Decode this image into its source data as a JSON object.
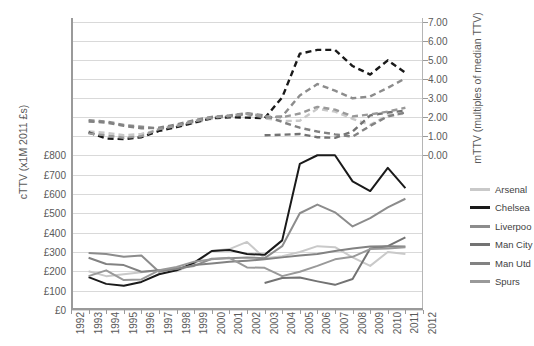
{
  "chart_data": {
    "type": "line",
    "title": "",
    "xlabel": "",
    "ylabel": "cTTV (x1M 2011 £s)",
    "y2label": "mTTV (multiples of median TTV)",
    "x": [
      1992,
      1993,
      1994,
      1995,
      1996,
      1997,
      1998,
      1999,
      2000,
      2001,
      2002,
      2003,
      2004,
      2005,
      2006,
      2007,
      2008,
      2009,
      2010,
      2011,
      2012
    ],
    "xlim": [
      1992,
      2012
    ],
    "xticklabels": [
      "1992",
      "1993",
      "1994",
      "1995",
      "1996",
      "1997",
      "1998",
      "1999",
      "2000",
      "2001",
      "2002",
      "2003",
      "2004",
      "2005",
      "2006",
      "2007",
      "2008",
      "2009",
      "2010",
      "2011",
      "2012"
    ],
    "ylim": [
      0,
      800
    ],
    "yticklabels": [
      "£0",
      "£100",
      "£200",
      "£300",
      "£400",
      "£500",
      "£600",
      "£700",
      "£800"
    ],
    "yticks": [
      0,
      100,
      200,
      300,
      400,
      500,
      600,
      700,
      800
    ],
    "y2lim": [
      0,
      7
    ],
    "y2ticklabels": [
      "0.00",
      "1.00",
      "2.00",
      "3.00",
      "4.00",
      "5.00",
      "6.00",
      "7.00"
    ],
    "y2ticks": [
      0,
      1,
      2,
      3,
      4,
      5,
      6,
      7
    ],
    "grid": true,
    "legend_position": "right",
    "series": [
      {
        "name": "Arsenal",
        "color": "#c9c9c9",
        "style": "solid",
        "axis": "left",
        "x": [
          1993,
          1994,
          1995,
          1996,
          1997,
          1998,
          1999,
          2000,
          2001,
          2002,
          2003,
          2004,
          2005,
          2006,
          2007,
          2008,
          2009,
          2010,
          2011
        ],
        "values": [
          200,
          175,
          185,
          195,
          205,
          200,
          240,
          305,
          315,
          352,
          268,
          278,
          300,
          330,
          325,
          272,
          228,
          300,
          290
        ]
      },
      {
        "name": "Chelsea",
        "color": "#1a1a1a",
        "style": "solid",
        "axis": "left",
        "x": [
          1993,
          1994,
          1995,
          1996,
          1997,
          1998,
          1999,
          2000,
          2001,
          2002,
          2003,
          2004,
          2005,
          2006,
          2007,
          2008,
          2009,
          2010,
          2011
        ],
        "values": [
          170,
          135,
          125,
          145,
          185,
          205,
          245,
          305,
          310,
          290,
          285,
          360,
          755,
          800,
          800,
          665,
          615,
          735,
          630
        ]
      },
      {
        "name": "Liverpool",
        "color": "#8c8c8c",
        "style": "solid",
        "axis": "left",
        "x": [
          1993,
          1994,
          1995,
          1996,
          1997,
          1998,
          1999,
          2000,
          2001,
          2002,
          2003,
          2004,
          2005,
          2006,
          2007,
          2008,
          2009,
          2010,
          2011
        ],
        "values": [
          295,
          290,
          275,
          282,
          198,
          215,
          228,
          265,
          268,
          272,
          268,
          330,
          500,
          545,
          505,
          432,
          475,
          530,
          575
        ]
      },
      {
        "name": "Man City",
        "color": "#737373",
        "style": "solid",
        "axis": "left",
        "x": [
          2003,
          2004,
          2005,
          2006,
          2007,
          2008,
          2009,
          2010,
          2011
        ],
        "values": [
          140,
          165,
          168,
          148,
          130,
          160,
          318,
          330,
          375
        ]
      },
      {
        "name": "Man Utd",
        "color": "#828282",
        "style": "solid",
        "axis": "left",
        "x": [
          1993,
          1994,
          1995,
          1996,
          1997,
          1998,
          1999,
          2000,
          2001,
          2002,
          2003,
          2004,
          2005,
          2006,
          2007,
          2008,
          2009,
          2010,
          2011
        ],
        "values": [
          270,
          238,
          232,
          198,
          205,
          212,
          232,
          240,
          250,
          255,
          262,
          272,
          282,
          290,
          305,
          318,
          328,
          330,
          328
        ]
      },
      {
        "name": "Spurs",
        "color": "#999999",
        "style": "solid",
        "axis": "left",
        "x": [
          1993,
          1994,
          1995,
          1996,
          1997,
          1998,
          1999,
          2000,
          2001,
          2002,
          2003,
          2004,
          2005,
          2006,
          2007,
          2008,
          2009,
          2010,
          2011
        ],
        "values": [
          175,
          205,
          155,
          158,
          205,
          222,
          250,
          262,
          270,
          220,
          218,
          175,
          198,
          228,
          262,
          275,
          315,
          318,
          325
        ]
      },
      {
        "name": "Arsenal",
        "color": "#c9c9c9",
        "style": "dashed",
        "axis": "right",
        "x": [
          1993,
          1994,
          1995,
          1996,
          1997,
          1998,
          1999,
          2000,
          2001,
          2002,
          2003,
          2004,
          2005,
          2006,
          2007,
          2008,
          2009,
          2010,
          2011
        ],
        "values": [
          1.25,
          1.18,
          1.05,
          1.12,
          1.35,
          1.5,
          1.7,
          1.92,
          2.02,
          2.15,
          1.95,
          1.8,
          1.82,
          2.45,
          2.3,
          1.92,
          1.6,
          2.1,
          2.2
        ]
      },
      {
        "name": "Chelsea",
        "color": "#1a1a1a",
        "style": "dashed",
        "axis": "right",
        "x": [
          1993,
          1994,
          1995,
          1996,
          1997,
          1998,
          1999,
          2000,
          2001,
          2002,
          2003,
          2004,
          2005,
          2006,
          2007,
          2008,
          2009,
          2010,
          2011
        ],
        "values": [
          1.2,
          0.88,
          0.85,
          0.95,
          1.28,
          1.48,
          1.72,
          1.95,
          2.0,
          1.98,
          1.95,
          3.05,
          5.35,
          5.55,
          5.55,
          4.7,
          4.25,
          5.0,
          4.35
        ]
      },
      {
        "name": "Liverpool",
        "color": "#8c8c8c",
        "style": "dashed",
        "axis": "right",
        "x": [
          1993,
          1994,
          1995,
          1996,
          1997,
          1998,
          1999,
          2000,
          2001,
          2002,
          2003,
          2004,
          2005,
          2006,
          2007,
          2008,
          2009,
          2010,
          2011
        ],
        "values": [
          1.85,
          1.78,
          1.6,
          1.5,
          1.4,
          1.55,
          1.78,
          1.98,
          2.05,
          2.18,
          1.98,
          2.05,
          3.15,
          3.75,
          3.4,
          3.0,
          3.1,
          3.55,
          4.05
        ]
      },
      {
        "name": "Man City",
        "color": "#737373",
        "style": "dashed",
        "axis": "right",
        "x": [
          2003,
          2004,
          2005,
          2006,
          2007,
          2008,
          2009,
          2010,
          2011
        ],
        "values": [
          1.05,
          1.08,
          1.12,
          0.95,
          0.92,
          1.25,
          2.1,
          2.25,
          2.35
        ]
      },
      {
        "name": "Man Utd",
        "color": "#828282",
        "style": "dashed",
        "axis": "right",
        "x": [
          1993,
          1994,
          1995,
          1996,
          1997,
          1998,
          1999,
          2000,
          2001,
          2002,
          2003,
          2004,
          2005,
          2006,
          2007,
          2008,
          2009,
          2010,
          2011
        ],
        "values": [
          1.78,
          1.72,
          1.55,
          1.42,
          1.45,
          1.62,
          1.85,
          2.02,
          2.1,
          2.22,
          2.1,
          1.75,
          1.45,
          1.25,
          1.1,
          0.98,
          1.55,
          2.05,
          2.25
        ]
      },
      {
        "name": "Spurs",
        "color": "#999999",
        "style": "dashed",
        "axis": "right",
        "x": [
          1993,
          1994,
          1995,
          1996,
          1997,
          1998,
          1999,
          2000,
          2001,
          2002,
          2003,
          2004,
          2005,
          2006,
          2007,
          2008,
          2009,
          2010,
          2011
        ],
        "values": [
          1.15,
          1.05,
          0.92,
          1.0,
          1.38,
          1.55,
          1.8,
          2.0,
          2.08,
          2.2,
          2.05,
          2.0,
          2.2,
          2.55,
          2.4,
          2.05,
          2.15,
          2.3,
          2.5
        ]
      }
    ]
  },
  "legend": {
    "items": [
      {
        "label": "Arsenal",
        "color": "#c9c9c9"
      },
      {
        "label": "Chelsea",
        "color": "#1a1a1a"
      },
      {
        "label": "Liverpoo",
        "color": "#8c8c8c"
      },
      {
        "label": "Man City",
        "color": "#737373"
      },
      {
        "label": "Man Utd",
        "color": "#828282"
      },
      {
        "label": "Spurs",
        "color": "#999999"
      }
    ]
  }
}
